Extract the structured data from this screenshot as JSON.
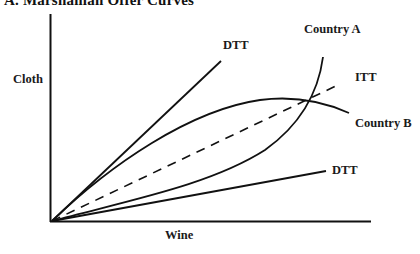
{
  "figure": {
    "title": "A. Marshallian Offer Curves",
    "axes": {
      "x_label": "Wine",
      "y_label": "Cloth"
    },
    "curves": {
      "dtt_upper_label": "DTT",
      "dtt_lower_label": "DTT",
      "itt_label": "ITT",
      "country_a_label": "Country A",
      "country_b_label": "Country B"
    },
    "colors": {
      "ink": "#111111",
      "background": "#ffffff"
    }
  }
}
